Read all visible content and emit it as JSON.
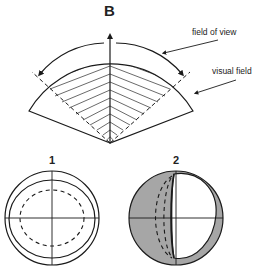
{
  "figure": {
    "panel_label": "B",
    "labels": {
      "field_of_view": "field of view",
      "visual_field": "visual field"
    },
    "subfigures": [
      {
        "number": "1",
        "description": "concentric circles with dashed inner ellipse and crosshair"
      },
      {
        "number": "2",
        "description": "circle with gray-shaded left region, dashed arcs, and white right crescent area"
      }
    ],
    "colors": {
      "line": "#1a1a1a",
      "shade": "#a6a6a6",
      "background": "#ffffff"
    }
  }
}
